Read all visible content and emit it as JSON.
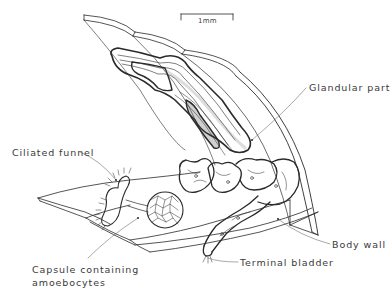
{
  "figure": {
    "type": "anatomical-diagram",
    "colors": {
      "ink": "#2a2a2a",
      "background": "#ffffff",
      "label": "#3a3a3a"
    }
  },
  "scale_bar": {
    "label": "1mm"
  },
  "labels": {
    "glandular_part": "Glandular part",
    "ciliated_funnel": "Ciliated funnel",
    "body_wall": "Body wall",
    "terminal_bladder": "Terminal bladder",
    "capsule_line1": "Capsule  containing",
    "capsule_line2": "amoebocytes"
  }
}
